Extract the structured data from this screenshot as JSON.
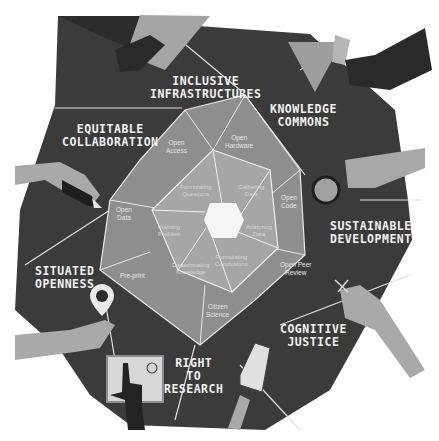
{
  "diagram": {
    "colors": {
      "background": "#ffffff",
      "outer_polygon": "#3b3b3b",
      "middle_polygon": "#8e8e8e",
      "inner_polygon": "#a6a6a6",
      "center_hexagon": "#f5f5f5",
      "lines": "#e8e8e8",
      "hands_light": "#a9a9a9",
      "hands_dark": "#2a2a2a"
    },
    "principles": [
      {
        "line1": "INCLUSIVE",
        "line2": "INFRASTRUCTURES"
      },
      {
        "line1": "KNOWLEDGE",
        "line2": "COMMONS"
      },
      {
        "line1": "EQUITABLE",
        "line2": "COLLABORATION"
      },
      {
        "line1": "SUSTAINABLE",
        "line2": "DEVELOPMENT"
      },
      {
        "line1": "SITUATED",
        "line2": "OPENNESS"
      },
      {
        "line1": "COGNITIVE",
        "line2": "JUSTICE"
      },
      {
        "line1": "RIGHT",
        "line2": "TO",
        "line3": "RESEARCH"
      }
    ],
    "practices": [
      {
        "line1": "Open",
        "line2": "Access"
      },
      {
        "line1": "Open",
        "line2": "Hardware"
      },
      {
        "line1": "Open",
        "line2": "Code"
      },
      {
        "line1": "Open Peer",
        "line2": "Review"
      },
      {
        "line1": "Citizen",
        "line2": "Science"
      },
      {
        "line1": "Pre-print",
        "line2": ""
      },
      {
        "line1": "Open",
        "line2": "Data"
      }
    ],
    "research_stages": [
      {
        "line1": "Formulating",
        "line2": "Questions"
      },
      {
        "line1": "Gathering",
        "line2": "Data"
      },
      {
        "line1": "Analyzing",
        "line2": "Data"
      },
      {
        "line1": "Formulating",
        "line2": "Conclusions"
      },
      {
        "line1": "Disseminating",
        "line2": "Knowledge"
      },
      {
        "line1": "Framing",
        "line2": "Problem"
      }
    ],
    "illustrations": [
      "handshake-icon",
      "triangle-book-icon",
      "magnifying-glass-icon",
      "pencil-hand-icon",
      "location-pin-icon",
      "tablet-touch-icon",
      "smartphone-icon",
      "scissors-hand-icon"
    ]
  }
}
